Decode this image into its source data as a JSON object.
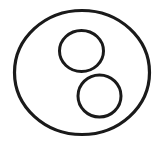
{
  "figure": {
    "kind": "line-drawing",
    "canvas": {
      "width": 161,
      "height": 150,
      "background_color": "#ffffff"
    },
    "stroke_color": "#1a1a1a",
    "fill_color": "none",
    "shapes": [
      {
        "id": "outer-ellipse",
        "name": "outer-circle",
        "type": "ellipse",
        "cx": 82,
        "cy": 72.5,
        "rx": 67.5,
        "ry": 62,
        "stroke_width": 3.2
      },
      {
        "id": "upper-inner-circle",
        "name": "upper-inner-circle",
        "type": "ellipse",
        "cx": 81.5,
        "cy": 51,
        "rx": 22,
        "ry": 20.5,
        "stroke_width": 3.0
      },
      {
        "id": "lower-inner-circle",
        "name": "lower-inner-circle",
        "type": "ellipse",
        "cx": 99.5,
        "cy": 96,
        "rx": 21.5,
        "ry": 21,
        "stroke_width": 3.0
      }
    ]
  }
}
